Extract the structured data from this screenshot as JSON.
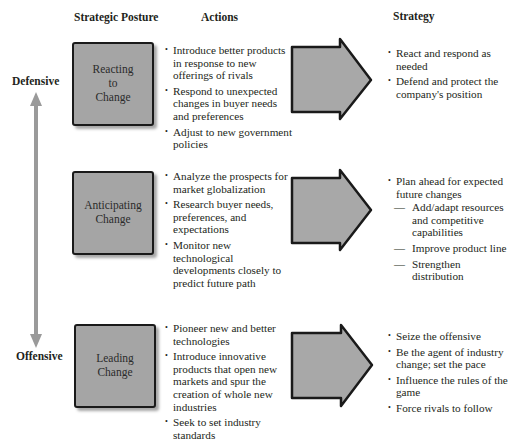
{
  "headers": {
    "posture": "Strategic Posture",
    "actions": "Actions",
    "strategy": "Strategy"
  },
  "axis": {
    "top_label": "Defensive",
    "bottom_label": "Offensive",
    "arrow_color": "#9a9a9a"
  },
  "colors": {
    "box_fill": "#a5a5a5",
    "box_border": "#1a1a1a",
    "arrow_fill": "#a8a8a8"
  },
  "rows": [
    {
      "posture_lines": [
        "Reacting",
        "to",
        "Change"
      ],
      "actions": [
        "Introduce better products in response to new offerings of rivals",
        "Respond to unexpected changes in buyer needs and preferences",
        "Adjust to new government policies"
      ],
      "strategy": [
        {
          "text": "React and respond as needed",
          "sub": []
        },
        {
          "text": "Defend and protect the company's position",
          "sub": []
        }
      ]
    },
    {
      "posture_lines": [
        "Anticipating",
        "Change"
      ],
      "actions": [
        "Analyze the prospects for market globalization",
        "Research buyer needs, preferences, and expectations",
        "Monitor new technological developments closely to predict future path"
      ],
      "strategy": [
        {
          "text": "Plan ahead for expected future changes",
          "sub": [
            "Add/adapt resources and competitive capabilities",
            "Improve product line",
            "Strengthen distribution"
          ]
        }
      ]
    },
    {
      "posture_lines": [
        "Leading",
        "Change"
      ],
      "actions": [
        "Pioneer new and better technologies",
        "Introduce innovative products that open new markets and spur the creation of whole new industries",
        "Seek to set industry standards"
      ],
      "strategy": [
        {
          "text": "Seize the offensive",
          "sub": []
        },
        {
          "text": "Be the agent of industry change; set the pace",
          "sub": []
        },
        {
          "text": "Influence the rules of the game",
          "sub": []
        },
        {
          "text": "Force rivals to follow",
          "sub": []
        }
      ]
    }
  ]
}
